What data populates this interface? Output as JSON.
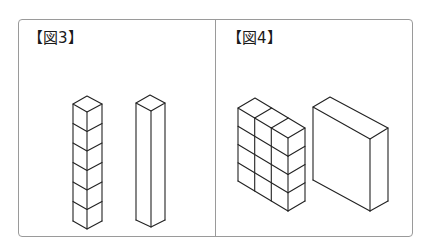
{
  "panels": [
    {
      "label": "【図3】",
      "figures": [
        {
          "name": "stacked-unit-cubes",
          "count": 6,
          "arrangement": "1 wide x 6 tall x 1 deep"
        },
        {
          "name": "rectangular-prism",
          "dimensions": "1 x 6 x 1"
        }
      ]
    },
    {
      "label": "【図4】",
      "figures": [
        {
          "name": "cube-wall",
          "count": 12,
          "arrangement": "3 wide x 4 tall x 1 deep"
        },
        {
          "name": "rectangular-slab",
          "dimensions": "3 x 4 x 1"
        }
      ]
    }
  ],
  "colors": {
    "line": "#222222",
    "border": "#9a9a9a",
    "background": "#ffffff"
  }
}
